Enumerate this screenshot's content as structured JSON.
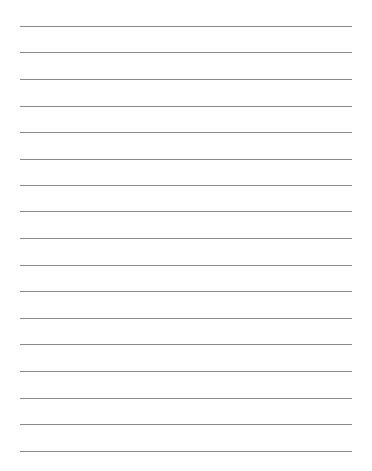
{
  "document": {
    "type": "lined-paper",
    "background_color": "#ffffff",
    "rule_color": "#8a8a8a",
    "rule_left_px": 20,
    "rule_right_px": 352,
    "rule_count": 17,
    "rule_positions_px": [
      26,
      52,
      79,
      106,
      132,
      159,
      185,
      211,
      238,
      265,
      291,
      318,
      344,
      371,
      398,
      424,
      451
    ],
    "text_lines": [
      "",
      "",
      "",
      "",
      "",
      "",
      "",
      "",
      "",
      "",
      "",
      "",
      "",
      "",
      "",
      "",
      ""
    ]
  }
}
